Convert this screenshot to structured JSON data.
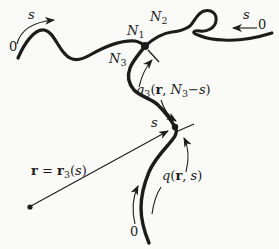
{
  "colors": {
    "ink": "#1c1c1c",
    "background": "#fafaf8"
  },
  "labels": {
    "arm1_contour": "s",
    "arm1_origin": "0",
    "arm2_contour": "s",
    "arm2_origin": "0",
    "arm3_origin": "0",
    "point_s": "s",
    "n1": {
      "base": "N",
      "sub": "1"
    },
    "n2": {
      "base": "N",
      "sub": "2"
    },
    "n3": {
      "base": "N",
      "sub": "3"
    },
    "q3": {
      "func": "q",
      "func_sub": "3",
      "open": "(",
      "arg_r": "r",
      "comma": ", ",
      "arg_n": "N",
      "arg_n_sub": "3",
      "minus": "−",
      "arg_s": "s",
      "close": ")"
    },
    "r_eq": {
      "lhs": "r",
      "equals": " = ",
      "rhs": "r",
      "rhs_sub": "3",
      "open": "(",
      "arg_s": "s",
      "close": ")"
    },
    "q": {
      "func": "q",
      "open": "(",
      "arg_r": "r",
      "comma": ", ",
      "arg_s": "s",
      "close": ")"
    }
  }
}
